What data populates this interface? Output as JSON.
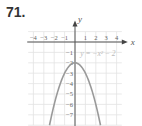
{
  "problem_number": "71.",
  "chart_data": {
    "type": "line",
    "title": "",
    "equation_label": "y = −x² − 2",
    "xlabel": "x",
    "ylabel": "y",
    "xlim": [
      -4.5,
      4.5
    ],
    "ylim": [
      -8,
      1
    ],
    "x_ticks": [
      -4,
      -3,
      -2,
      -1,
      1,
      2,
      3,
      4
    ],
    "y_ticks": [
      -1,
      -2,
      -3,
      -4,
      -5,
      -6,
      -7
    ],
    "grid": true,
    "series": [
      {
        "name": "y = -x^2 - 2",
        "x": [
          -2.45,
          -2,
          -1.5,
          -1,
          -0.5,
          0,
          0.5,
          1,
          1.5,
          2,
          2.45
        ],
        "y": [
          -8,
          -6,
          -4.25,
          -3,
          -2.25,
          -2,
          -2.25,
          -3,
          -4.25,
          -6,
          -8
        ]
      }
    ],
    "vertex": [
      0,
      -2
    ],
    "curve_color": "#999999"
  }
}
